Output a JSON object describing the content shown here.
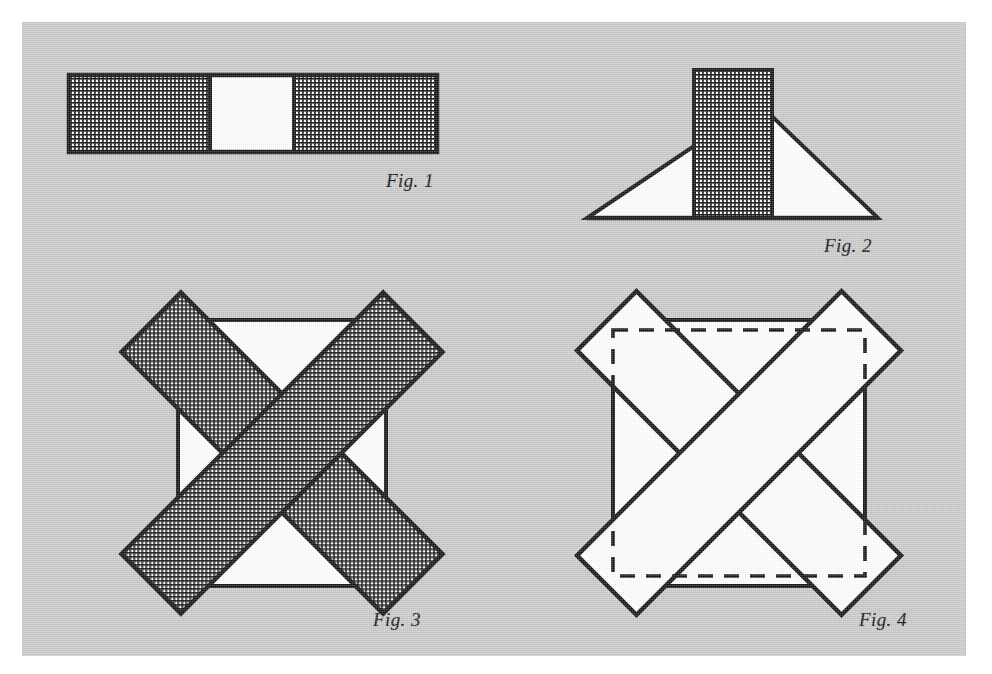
{
  "plate": {
    "title": "Geometric dissection figure plate",
    "background_color": "#ffffff",
    "paper_color": "#cbcbcb",
    "ink_color": "#141414",
    "fill_white": "#ffffff"
  },
  "labels": {
    "fig1": "Fig. 1",
    "fig2": "Fig. 2",
    "fig3": "Fig. 3",
    "fig4": "Fig. 4"
  },
  "figures": [
    {
      "id": "fig1",
      "label": "Fig. 1",
      "description": "Horizontal rectangular bar divided into three cells: a hatched left cell, a blank white middle cell, and a hatched right cell.",
      "cells": [
        {
          "name": "left-cell",
          "fill": "hatched"
        },
        {
          "name": "middle-cell",
          "fill": "white"
        },
        {
          "name": "right-cell",
          "fill": "hatched"
        }
      ]
    },
    {
      "id": "fig2",
      "label": "Fig. 2",
      "description": "An isosceles triangle on a horizontal base with a tall hatched vertical rectangle standing on the base and rising above the triangle apex.",
      "parts": [
        {
          "name": "triangle",
          "fill": "white"
        },
        {
          "name": "vertical-band",
          "fill": "hatched"
        }
      ]
    },
    {
      "id": "fig3",
      "label": "Fig. 3",
      "description": "A white square overlaid by two long hatched bands crossing at right angles along the diagonals, forming an X whose ends project past the square corners.",
      "parts": [
        {
          "name": "square",
          "fill": "white"
        },
        {
          "name": "diagonal-band-1",
          "fill": "hatched"
        },
        {
          "name": "diagonal-band-2",
          "fill": "hatched"
        }
      ]
    },
    {
      "id": "fig4",
      "label": "Fig. 4",
      "description": "The same square-and-crossed-bands construction as Fig. 3 drawn in outline only, with a dashed square circumscribing the four projecting band tips.",
      "parts": [
        {
          "name": "square",
          "fill": "white",
          "stroke": "solid"
        },
        {
          "name": "diagonal-band-1",
          "fill": "white",
          "stroke": "solid"
        },
        {
          "name": "diagonal-band-2",
          "fill": "white",
          "stroke": "solid"
        },
        {
          "name": "bounding-square",
          "fill": "none",
          "stroke": "dashed"
        }
      ]
    }
  ]
}
